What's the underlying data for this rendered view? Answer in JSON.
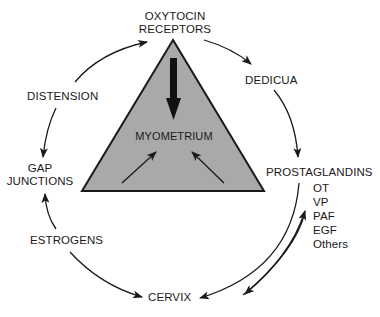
{
  "diagram": {
    "center": {
      "label": "MYOMETRIUM"
    },
    "nodes": {
      "oxytocin_receptors": {
        "line1": "OXYTOCIN",
        "line2": "RECEPTORS"
      },
      "dedicua": {
        "label": "DEDICUA"
      },
      "prostaglandins": {
        "label": "PROSTAGLANDINS",
        "sub_items": [
          "OT",
          "VP",
          "PAF",
          "EGF",
          "Others"
        ]
      },
      "cervix": {
        "label": "CERVIX"
      },
      "estrogens": {
        "label": "ESTROGENS"
      },
      "gap_junctions": {
        "line1": "GAP",
        "line2": "JUNCTIONS"
      },
      "distension": {
        "label": "DISTENSION"
      }
    },
    "colors": {
      "triangle_fill": "#a9a9a9",
      "stroke": "#1a1a1a",
      "background": "#ffffff"
    }
  }
}
